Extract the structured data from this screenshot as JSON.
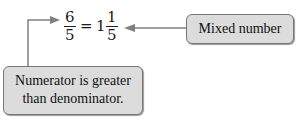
{
  "equation": {
    "improper_fraction": {
      "numerator": "6",
      "denominator": "5"
    },
    "equals": "=",
    "mixed_number": {
      "whole": "1",
      "numerator": "1",
      "denominator": "5"
    }
  },
  "callouts": {
    "mixed_number_label": "Mixed number",
    "numerator_label_line1": "Numerator is greater",
    "numerator_label_line2": "than denominator."
  },
  "colors": {
    "box_fill": "#dcdcdc",
    "box_border": "#777777",
    "arrow": "#808080"
  }
}
